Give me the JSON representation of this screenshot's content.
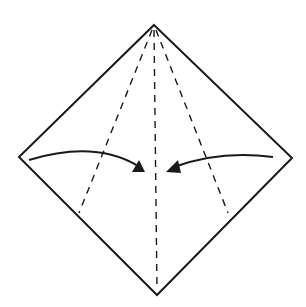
{
  "diagram": {
    "type": "origami-fold-step",
    "colors": {
      "background": "#ffffff",
      "line": "#1a1a1a"
    },
    "square": {
      "top": [
        154,
        25
      ],
      "right": [
        292,
        158
      ],
      "bottom": [
        157,
        295
      ],
      "left": [
        19,
        157
      ]
    },
    "valley_folds": [
      {
        "from": [
          153,
          28
        ],
        "to": [
          79,
          213
        ]
      },
      {
        "from": [
          154,
          28
        ],
        "to": [
          157,
          290
        ]
      },
      {
        "from": [
          155,
          28
        ],
        "to": [
          228,
          213
        ]
      }
    ],
    "arrows": [
      {
        "direction": "right",
        "path": "M29,160 Q95,140 143,171",
        "head": [
          145,
          172
        ]
      },
      {
        "direction": "left",
        "path": "M273,157 Q220,150 170,171",
        "head": [
          167,
          172
        ]
      }
    ]
  }
}
